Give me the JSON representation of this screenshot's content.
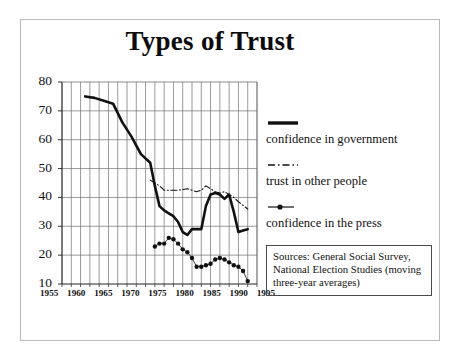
{
  "slide": {
    "title": "Types of Trust",
    "border_color": "#b9b9b9"
  },
  "legend": {
    "items": [
      {
        "label": "confidence in government",
        "style": "solid-thick",
        "color": "#111111"
      },
      {
        "label": "trust in other people",
        "style": "dash-dot",
        "color": "#111111"
      },
      {
        "label": "confidence in the press",
        "style": "line-with-dot",
        "color": "#111111"
      }
    ]
  },
  "sources": {
    "text": "Sources: General Social Survey, National Election Studies (moving three-year averages)"
  },
  "chart_data": {
    "type": "line",
    "title": "Types of Trust",
    "xlabel": "",
    "ylabel": "",
    "xlim": [
      1953,
      1995
    ],
    "ylim": [
      10,
      80
    ],
    "yticks": [
      10,
      20,
      30,
      40,
      50,
      60,
      70,
      80
    ],
    "xticks": [
      1955,
      1960,
      1965,
      1970,
      1975,
      1980,
      1985,
      1990,
      1995
    ],
    "grid": true,
    "grid_x_step": 2,
    "grid_y_step": 10,
    "legend_position": "right",
    "series": [
      {
        "name": "confidence in government",
        "style": "solid-thick",
        "color": "#111111",
        "x": [
          1958,
          1960,
          1962,
          1964,
          1966,
          1968,
          1970,
          1972,
          1973,
          1974,
          1975,
          1976,
          1977,
          1978,
          1979,
          1980,
          1981,
          1982,
          1983,
          1984,
          1985,
          1986,
          1987,
          1988,
          1989,
          1990,
          1991,
          1992,
          1993
        ],
        "y": [
          75,
          74.5,
          73.5,
          72.5,
          66,
          61,
          55,
          52,
          44,
          37,
          35.5,
          34.5,
          33.5,
          31.5,
          28,
          27,
          29,
          29,
          29,
          37,
          41,
          41.5,
          41,
          39.5,
          41,
          35,
          28,
          28.5,
          29
        ]
      },
      {
        "name": "trust in other people",
        "style": "dash-dot",
        "color": "#111111",
        "x": [
          1972,
          1974,
          1975,
          1976,
          1978,
          1980,
          1982,
          1983,
          1984,
          1986,
          1987,
          1988,
          1989,
          1990,
          1991,
          1993
        ],
        "y": [
          46,
          44,
          42.5,
          42.5,
          42.5,
          43,
          42,
          42.5,
          44,
          42,
          41.5,
          42,
          41,
          40,
          38.5,
          36
        ]
      },
      {
        "name": "confidence in the press",
        "style": "line-with-dot",
        "color": "#111111",
        "x": [
          1973,
          1974,
          1975,
          1976,
          1977,
          1978,
          1979,
          1980,
          1981,
          1982,
          1983,
          1984,
          1985,
          1986,
          1987,
          1988,
          1989,
          1990,
          1991,
          1992,
          1993
        ],
        "y": [
          23,
          24,
          24,
          26,
          25.5,
          24,
          22,
          21,
          19,
          16,
          16,
          16.5,
          17,
          18.5,
          19,
          18.5,
          17.5,
          16.5,
          16,
          14.5,
          11
        ]
      }
    ]
  }
}
